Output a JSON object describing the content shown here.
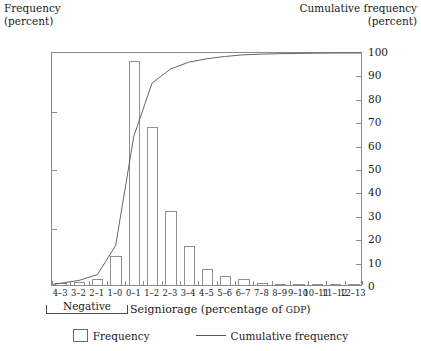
{
  "left_axis_title": "Frequency\n(percent)",
  "right_axis_title": "Cumulative frequency\n(percent)",
  "x_axis_title_main": "Seigniorage (percentage of ",
  "x_axis_title_smallcaps": "GDP",
  "x_axis_title_end": ")",
  "negative_label": "Negative",
  "legend": {
    "frequency": "Frequency",
    "cumulative": "Cumulative frequency",
    "swatch_icon": "bar-swatch-icon",
    "line_icon": "line-swatch-icon"
  },
  "colors": {
    "bar_stroke": "#8f8f8f",
    "bar_fill": "#ffffff",
    "curve": "#555555",
    "frame": "#8a8a8a",
    "text": "#1a1a1a"
  },
  "chart_data": {
    "type": "bar",
    "title": "",
    "xlabel": "Seigniorage (percentage of GDP)",
    "ylabel": "Frequency (percent)",
    "y2label": "Cumulative frequency (percent)",
    "ylim": [
      0,
      40
    ],
    "y2lim": [
      0,
      100
    ],
    "yticks": [
      0,
      10,
      20,
      30,
      40
    ],
    "y2ticks": [
      0,
      10,
      20,
      30,
      40,
      50,
      60,
      70,
      80,
      90,
      100
    ],
    "grid": false,
    "legend_position": "bottom-center",
    "categories": [
      "4–3",
      "3–2",
      "2–1",
      "1–0",
      "0–1",
      "1–2",
      "2–3",
      "3–4",
      "4–5",
      "5–6",
      "6–7",
      "7–8",
      "8–9",
      "9–10",
      "10–11",
      "11–12",
      "12–13"
    ],
    "series": [
      {
        "name": "Frequency",
        "type": "bar",
        "axis": "left",
        "values": [
          0.3,
          0.5,
          1.0,
          5.0,
          38.3,
          27.0,
          12.7,
          6.7,
          2.8,
          1.6,
          1.0,
          0.4,
          0.2,
          0.2,
          0.1,
          0.1,
          0.1
        ]
      },
      {
        "name": "Cumulative frequency",
        "type": "line",
        "axis": "right",
        "values": [
          0.8,
          2.0,
          4.5,
          17.0,
          64.0,
          87.0,
          93.0,
          96.0,
          97.5,
          98.5,
          99.2,
          99.5,
          99.7,
          99.8,
          99.9,
          100.0,
          100.0
        ]
      }
    ],
    "annotations": [
      {
        "text": "Negative",
        "spans_categories": [
          "4–3",
          "1–0"
        ],
        "position": "below-axis"
      }
    ]
  }
}
